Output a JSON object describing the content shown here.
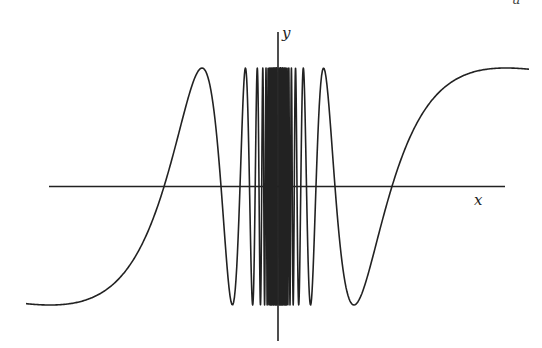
{
  "chart_data": {
    "type": "line",
    "title": "",
    "xlabel": "x",
    "ylabel": "y",
    "function": "y = sin(c / x)",
    "params": {
      "c": 358,
      "amplitude": 118.5,
      "origin_px": [
        278,
        186.5
      ],
      "x_range_px": [
        26,
        529
      ]
    },
    "grid": false,
    "legend": null,
    "series": [
      {
        "name": "sin(c/x)",
        "color": "#222222"
      }
    ],
    "key_points_px": {
      "left_end": [
        26,
        303
      ],
      "left_zero_crossings": [
        163,
        220,
        239
      ],
      "left_peaks": [
        201,
        246
      ],
      "left_trough": [
        232
      ],
      "right_zero_crossings": [
        391,
        335
      ],
      "right_peaks": [
        323
      ],
      "right_trough": [
        353
      ],
      "right_end": [
        529,
        70
      ]
    },
    "axes": {
      "x_axis": {
        "from": [
          49,
          186.5
        ],
        "to": [
          505,
          186.5
        ]
      },
      "y_axis": {
        "from": [
          278,
          32
        ],
        "to": [
          278,
          341
        ]
      }
    }
  },
  "labels": {
    "x": "x",
    "y": "y",
    "corner_fragment": "u"
  },
  "colors": {
    "curve": "#222222",
    "axis": "#222222",
    "background": "#ffffff"
  }
}
